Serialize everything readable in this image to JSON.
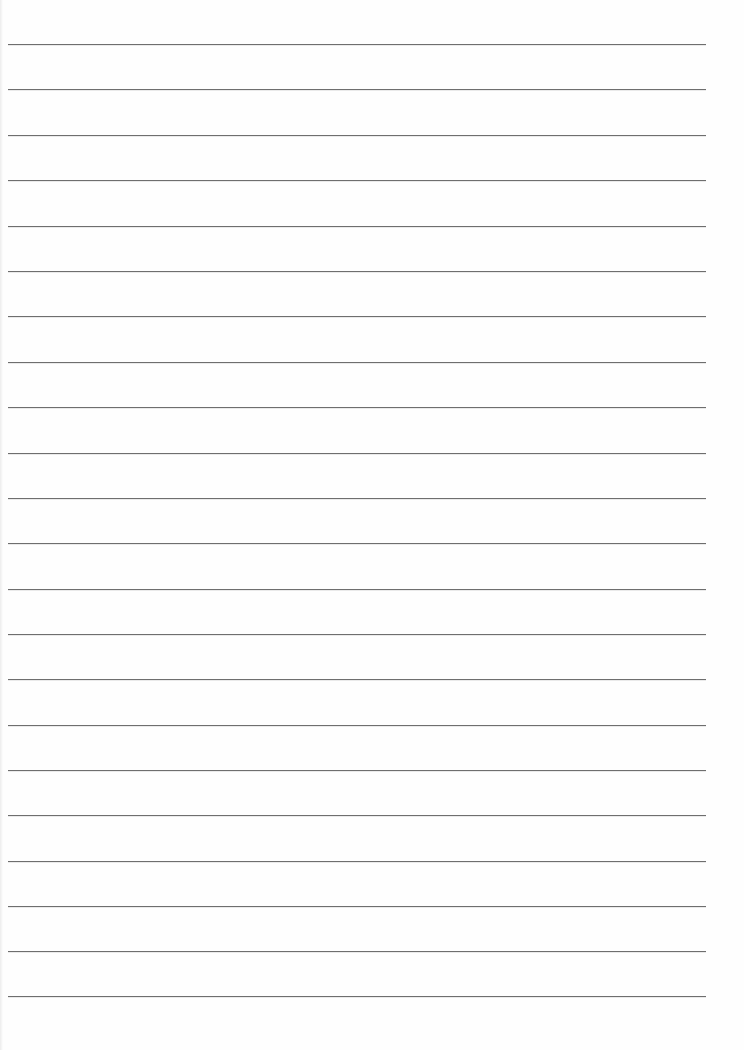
{
  "document": {
    "type": "ruled-paper",
    "background_color": "#fefefe",
    "rule_color": "#6e6e6e",
    "rule_count": 22,
    "rule_left": 8,
    "rule_right": 706,
    "rule_positions": [
      44,
      89,
      135,
      180,
      226,
      271,
      316,
      362,
      407,
      453,
      498,
      543,
      589,
      634,
      679,
      725,
      770,
      815,
      861,
      906,
      951,
      996
    ]
  }
}
